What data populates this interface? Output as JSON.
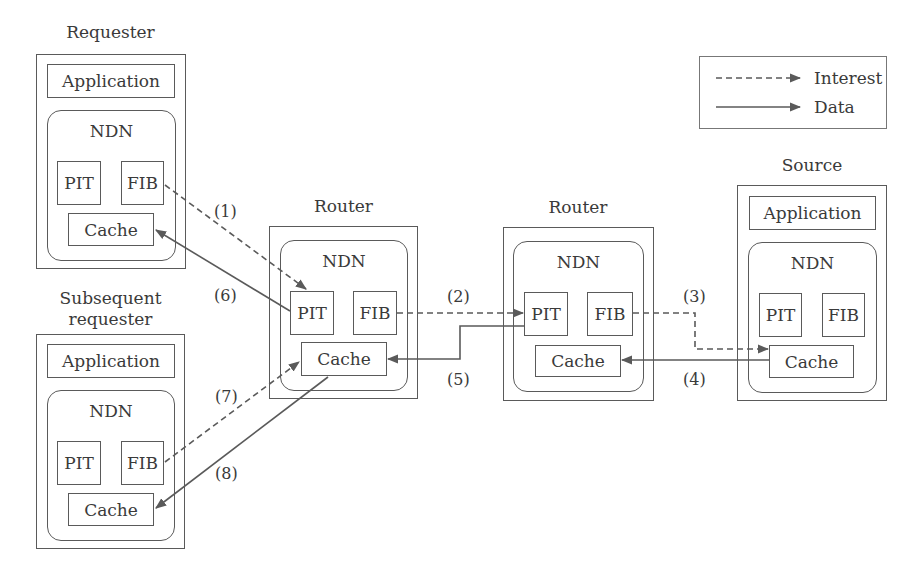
{
  "nodes": {
    "requester": {
      "title": "Requester",
      "application": "Application",
      "ndn": "NDN",
      "pit": "PIT",
      "fib": "FIB",
      "cache": "Cache"
    },
    "subsequent_requester": {
      "title_line1": "Subsequent",
      "title_line2": "requester",
      "application": "Application",
      "ndn": "NDN",
      "pit": "PIT",
      "fib": "FIB",
      "cache": "Cache"
    },
    "router1": {
      "title": "Router",
      "ndn": "NDN",
      "pit": "PIT",
      "fib": "FIB",
      "cache": "Cache"
    },
    "router2": {
      "title": "Router",
      "ndn": "NDN",
      "pit": "PIT",
      "fib": "FIB",
      "cache": "Cache"
    },
    "source": {
      "title": "Source",
      "application": "Application",
      "ndn": "NDN",
      "pit": "PIT",
      "fib": "FIB",
      "cache": "Cache"
    }
  },
  "legend": {
    "interest": "Interest",
    "data": "Data"
  },
  "steps": [
    {
      "label": "(1)",
      "type": "interest",
      "from": "Requester FIB",
      "to": "Router PIT"
    },
    {
      "label": "(2)",
      "type": "interest",
      "from": "Router FIB",
      "to": "Router PIT"
    },
    {
      "label": "(3)",
      "type": "interest",
      "from": "Router FIB",
      "to": "Source Cache"
    },
    {
      "label": "(4)",
      "type": "data",
      "from": "Source Cache",
      "to": "Router Cache"
    },
    {
      "label": "(5)",
      "type": "data",
      "from": "Router PIT",
      "to": "Router Cache"
    },
    {
      "label": "(6)",
      "type": "data",
      "from": "Router PIT",
      "to": "Requester Cache"
    },
    {
      "label": "(7)",
      "type": "interest",
      "from": "Subsequent requester FIB",
      "to": "Router Cache"
    },
    {
      "label": "(8)",
      "type": "data",
      "from": "Router Cache",
      "to": "Subsequent requester Cache"
    }
  ],
  "colors": {
    "line": "#5a5a5a",
    "text": "#3a3a3a"
  }
}
